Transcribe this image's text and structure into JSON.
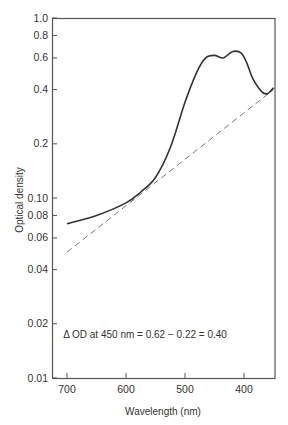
{
  "chart_data": {
    "type": "line",
    "title": "",
    "xlabel": "Wavelength (nm)",
    "ylabel": "Optical density",
    "xlim": [
      725,
      350
    ],
    "x_reversed": true,
    "ylim": [
      0.01,
      1.0
    ],
    "yscale": "log",
    "x_ticks": [
      700,
      600,
      500,
      400
    ],
    "x_tick_labels": [
      "700",
      "600",
      "500",
      "400"
    ],
    "y_ticks": [
      1.0,
      0.8,
      0.6,
      0.4,
      0.2,
      0.1,
      0.08,
      0.06,
      0.04,
      0.02,
      0.01
    ],
    "y_tick_labels": [
      "1.0",
      "0.8",
      "0.6",
      "0.4",
      "0.2",
      "0.10",
      "0.08",
      "0.06",
      "0.04",
      "0.02",
      "0.01"
    ],
    "grid": false,
    "annotation": "Δ OD at 450 nm = 0.62 − 0.22 = 0.40",
    "series": [
      {
        "name": "absorption spectrum",
        "style": "solid",
        "x": [
          700,
          650,
          600,
          575,
          550,
          525,
          500,
          480,
          465,
          450,
          435,
          420,
          405,
          395,
          385,
          370,
          360,
          350
        ],
        "y": [
          0.072,
          0.08,
          0.094,
          0.108,
          0.13,
          0.19,
          0.34,
          0.5,
          0.6,
          0.62,
          0.6,
          0.65,
          0.64,
          0.56,
          0.46,
          0.39,
          0.38,
          0.41
        ]
      },
      {
        "name": "baseline (extrapolated)",
        "style": "dashed",
        "x": [
          700,
          350
        ],
        "y": [
          0.05,
          0.4
        ]
      }
    ]
  }
}
